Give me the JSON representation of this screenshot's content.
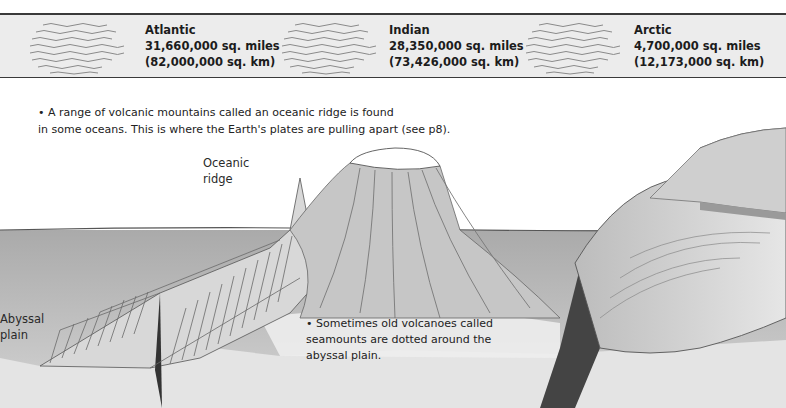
{
  "oceans": [
    {
      "name": "Atlantic",
      "area_miles": "31,660,000 sq. miles",
      "area_km": "(82,000,000 sq. km)"
    },
    {
      "name": "Indian",
      "area_miles": "28,350,000 sq. miles",
      "area_km": "(73,426,000 sq. km)"
    },
    {
      "name": "Arctic",
      "area_miles": "4,700,000 sq. miles",
      "area_km": "(12,173,000 sq. km)"
    }
  ],
  "captions": {
    "ridge_line1": "• A range of volcanic mountains called an oceanic ridge is found",
    "ridge_line2": "in some oceans. This is where the Earth's plates are pulling apart (see p8).",
    "seamount_line1": "• Sometimes old volcanoes called",
    "seamount_line2": "seamounts are dotted around the",
    "seamount_line3": "abyssal plain."
  },
  "labels": {
    "oceanic_ridge_1": "Oceanic",
    "oceanic_ridge_2": "ridge",
    "abyssal_plain_1": "Abyssal",
    "abyssal_plain_2": "plain"
  },
  "colors": {
    "band_bg": "#ececec",
    "water": "#b5b5b5",
    "seabed": "#e2e2e2",
    "ink": "#3a3a3a"
  }
}
